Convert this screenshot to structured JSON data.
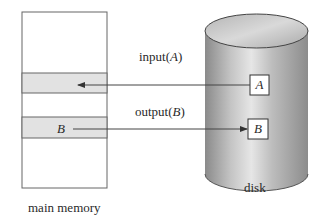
{
  "diagram": {
    "main_memory": {
      "label": "main memory",
      "blocks": [
        {
          "name": "slot-A",
          "label": "",
          "shaded": true
        },
        {
          "name": "slot-B",
          "label": "B",
          "shaded": true
        }
      ]
    },
    "disk": {
      "label": "disk",
      "blocks": [
        {
          "name": "A",
          "label": "A"
        },
        {
          "name": "B",
          "label": "B"
        }
      ]
    },
    "operations": [
      {
        "name": "input",
        "text": "input(",
        "arg": "A",
        "close": ")",
        "direction": "disk-to-memory"
      },
      {
        "name": "output",
        "text": "output(",
        "arg": "B",
        "close": ")",
        "direction": "memory-to-disk"
      }
    ],
    "colors": {
      "memory_fill": "#ffffff",
      "slot_fill": "#e2e2e2",
      "outline": "#555555",
      "disk_light": "#d8d8d8",
      "disk_dark": "#8f8f8f"
    }
  }
}
